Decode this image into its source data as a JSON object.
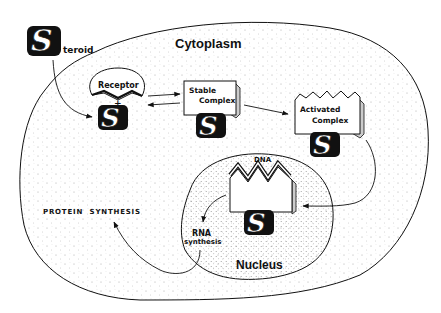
{
  "diagram": {
    "regions": {
      "cytoplasm": "Cytoplasm",
      "nucleus": "Nucleus"
    },
    "steroid": {
      "letter": "S",
      "suffix": "teroid"
    },
    "receptor": {
      "label": "Receptor",
      "plus": "+"
    },
    "stable_complex": {
      "line1": "Stable",
      "line2": "Complex"
    },
    "activated_complex": {
      "line1": "Activated",
      "line2": "Complex"
    },
    "dna": {
      "label": "DNA"
    },
    "rna": {
      "line1": "RNA",
      "line2": "synthesis"
    },
    "protein_synthesis": "PROTEIN  SYNTHESIS",
    "s_letter": "S",
    "colors": {
      "ink": "#111111",
      "background": "#ffffff",
      "stipple": "#9a9a9a"
    },
    "flow": [
      "Steroid -> Receptor binding",
      "Receptor + S <-> Stable Complex",
      "Stable Complex -> Activated Complex",
      "Activated Complex -> DNA (Nucleus)",
      "DNA -> RNA synthesis",
      "RNA synthesis -> PROTEIN SYNTHESIS"
    ]
  }
}
